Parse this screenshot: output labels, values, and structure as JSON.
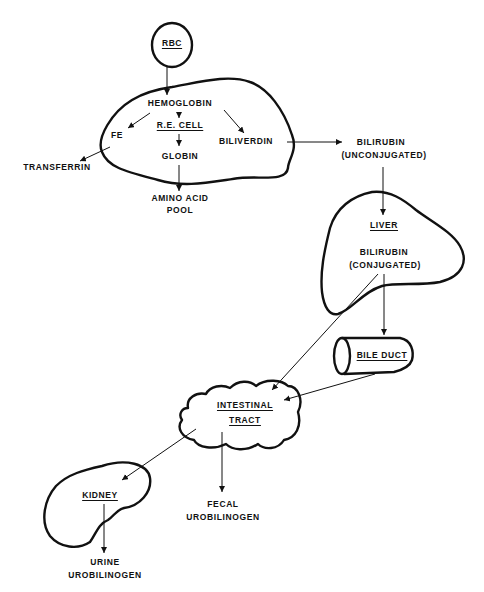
{
  "diagram": {
    "type": "flow",
    "nodes": {
      "rbc": "RBC",
      "hemoglobin": "HEMOGLOBIN",
      "re_cell": "R.E. CELL",
      "fe": "FE",
      "globin": "GLOBIN",
      "biliverdin": "BILIVERDIN",
      "transferrin": "TRANSFERRIN",
      "amino_acid_pool_line1": "AMINO ACID",
      "amino_acid_pool_line2": "POOL",
      "bilirubin_unconj_line1": "BILIRUBIN",
      "bilirubin_unconj_line2": "(UNCONJUGATED)",
      "liver": "LIVER",
      "bilirubin_conj_line1": "BILIRUBIN",
      "bilirubin_conj_line2": "(CONJUGATED)",
      "bile_duct": "BILE DUCT",
      "intestinal_tract_line1": "INTESTINAL",
      "intestinal_tract_line2": "TRACT",
      "kidney": "KIDNEY",
      "fecal_urobilinogen_line1": "FECAL",
      "fecal_urobilinogen_line2": "UROBILINOGEN",
      "urine_urobilinogen_line1": "URINE",
      "urine_urobilinogen_line2": "UROBILINOGEN"
    },
    "edges": [
      {
        "from": "RBC",
        "to": "HEMOGLOBIN"
      },
      {
        "from": "HEMOGLOBIN",
        "to": "R.E. CELL"
      },
      {
        "from": "HEMOGLOBIN",
        "to": "FE"
      },
      {
        "from": "HEMOGLOBIN",
        "to": "BILIVERDIN"
      },
      {
        "from": "R.E. CELL",
        "to": "GLOBIN"
      },
      {
        "from": "FE",
        "to": "TRANSFERRIN"
      },
      {
        "from": "GLOBIN",
        "to": "AMINO ACID POOL"
      },
      {
        "from": "BILIVERDIN",
        "to": "BILIRUBIN (UNCONJUGATED)"
      },
      {
        "from": "BILIRUBIN (UNCONJUGATED)",
        "to": "LIVER"
      },
      {
        "from": "BILIRUBIN (CONJUGATED)",
        "to": "BILE DUCT"
      },
      {
        "from": "BILIRUBIN (CONJUGATED)",
        "to": "INTESTINAL TRACT"
      },
      {
        "from": "BILE DUCT",
        "to": "INTESTINAL TRACT"
      },
      {
        "from": "INTESTINAL TRACT",
        "to": "KIDNEY"
      },
      {
        "from": "INTESTINAL TRACT",
        "to": "FECAL UROBILINOGEN"
      },
      {
        "from": "KIDNEY",
        "to": "URINE UROBILINOGEN"
      }
    ]
  }
}
